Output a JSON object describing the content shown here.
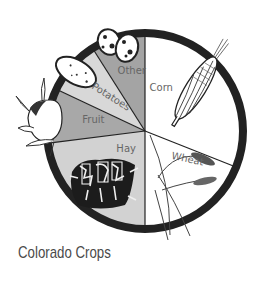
{
  "title": "Colorado Crops",
  "chart_data": {
    "type": "pie",
    "title": "Colorado Crops",
    "start_angle_deg": 0,
    "direction": "clockwise",
    "categories": [
      "Corn",
      "Wheat",
      "Hay",
      "Fruit",
      "Potatoes",
      "Other"
    ],
    "values": [
      31,
      19,
      23,
      9,
      9,
      9
    ],
    "unit": "approx. % share (estimated from slice angles)",
    "colors": [
      "#ffffff",
      "#ffffff",
      "#d2d2d2",
      "#a8a8a8",
      "#d8d8d8",
      "#a4a4a4"
    ],
    "legend": "none (labels inside slices)",
    "illustrations": [
      "corn-ear",
      "wheat-stalk",
      "hay-bale",
      "fruit-peach",
      "potato",
      "beans"
    ]
  },
  "style": {
    "ring_color": "#222222",
    "divider_color": "#222222",
    "label_color": "#666666",
    "title_color": "#4a4a4a"
  }
}
